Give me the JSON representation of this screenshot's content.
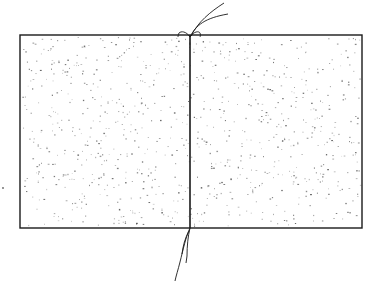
{
  "figure": {
    "type": "line-drawing",
    "colors": {
      "background": "#ffffff",
      "ink": "#1a1a1a",
      "speckle": "#555555"
    },
    "frame": {
      "x": 20,
      "y": 35,
      "width": 342,
      "height": 193
    },
    "seam_x": 190,
    "speckle_count": 900,
    "speckle_seed": 7,
    "stray_dot": {
      "x": 3,
      "y": 188
    }
  }
}
